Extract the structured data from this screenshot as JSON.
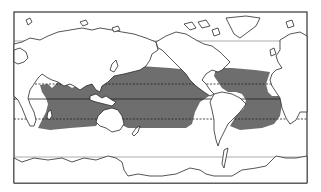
{
  "map": {
    "projection": "world, Pacific-centered",
    "frame": {
      "x": 14,
      "y": 12,
      "width": 293,
      "height": 171
    },
    "colors": {
      "background": "#ffffff",
      "land": "#ffffff",
      "outline": "#2a2a2a",
      "shaded_region": "#6e6e6e"
    },
    "reference_lines": [
      {
        "name": "arctic-circle",
        "y": 41,
        "style": "thin"
      },
      {
        "name": "tropic-of-cancer",
        "y": 84,
        "style": "dashed"
      },
      {
        "name": "equator",
        "y": 99,
        "style": "solid"
      },
      {
        "name": "tropic-of-capricorn",
        "y": 119,
        "style": "dashed"
      },
      {
        "name": "antarctic-circle",
        "y": 157,
        "style": "thin"
      }
    ],
    "shaded_regions": [
      {
        "name": "indo-pacific-tropical-ocean",
        "description": "Tropical Indian and Pacific Oceans"
      },
      {
        "name": "atlantic-tropical-ocean",
        "description": "Tropical Atlantic Ocean"
      }
    ]
  }
}
